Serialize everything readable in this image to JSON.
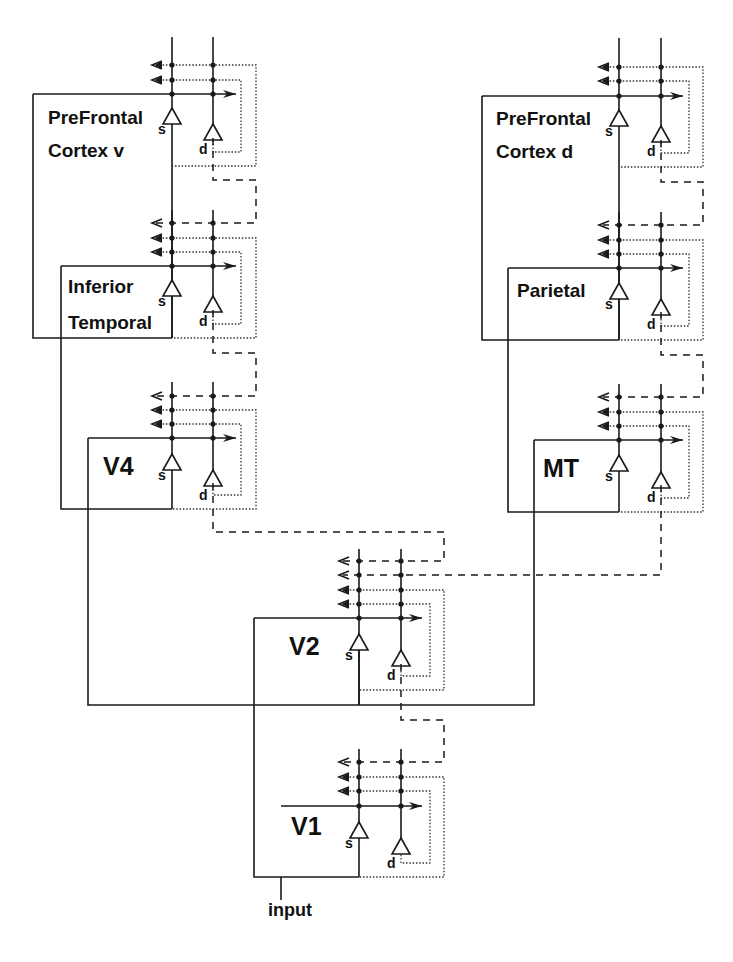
{
  "figure": {
    "type": "hierarchical cortical network diagram",
    "legend_line_styles": {
      "solid": "feedforward / module boundaries",
      "dotted": "within-module feedback loops",
      "dashed": "inter-module descending connections"
    }
  },
  "modules": [
    {
      "id": "pfcv",
      "label_lines": [
        "PreFrontal",
        "Cortex v"
      ],
      "label_size": "big",
      "s_x": 172,
      "d_x": 213,
      "top": 37,
      "dots": [
        65,
        80,
        94
      ],
      "box": {
        "x": 33,
        "y": 94,
        "w": 139,
        "h": 244
      },
      "label_pos": [
        48,
        124
      ],
      "line_gap": 33,
      "outer_x": 256,
      "inner_x": 241,
      "outer_bottom": 166,
      "inner_bottom": 152,
      "arrow_end": 236,
      "s_tri_y": 108,
      "d_tri_y": 124,
      "s_label": "s",
      "d_label": "d"
    },
    {
      "id": "it",
      "label_lines": [
        "Inferior",
        "Temporal"
      ],
      "label_size": "big",
      "s_x": 172,
      "d_x": 213,
      "top": 210,
      "dots": [
        223,
        238,
        252,
        266
      ],
      "box": {
        "x": 61,
        "y": 266,
        "w": 111,
        "h": 72
      },
      "label_pos": [
        68,
        293
      ],
      "line_gap": 36,
      "outer_x": 256,
      "inner_x": 241,
      "outer_bottom": 338,
      "inner_bottom": 324,
      "arrow_end": 236,
      "s_tri_y": 280,
      "d_tri_y": 296,
      "s_label": "s",
      "d_label": "d"
    },
    {
      "id": "v4",
      "label_lines": [
        "V4"
      ],
      "label_size": "huge",
      "s_x": 172,
      "d_x": 213,
      "top": 382,
      "dots": [
        396,
        410,
        424,
        438
      ],
      "box": {
        "x": 88,
        "y": 438,
        "w": 84,
        "h": 71
      },
      "label_pos": [
        103,
        475
      ],
      "line_gap": 0,
      "outer_x": 256,
      "inner_x": 241,
      "outer_bottom": 509,
      "inner_bottom": 495,
      "arrow_end": 236,
      "s_tri_y": 454,
      "d_tri_y": 470,
      "s_label": "s",
      "d_label": "d"
    },
    {
      "id": "pfcd",
      "label_lines": [
        "PreFrontal",
        "Cortex d"
      ],
      "label_size": "big",
      "s_x": 619,
      "d_x": 661,
      "top": 38,
      "dots": [
        67,
        81,
        96
      ],
      "box": {
        "x": 482,
        "y": 96,
        "w": 137,
        "h": 244
      },
      "label_pos": [
        496,
        125
      ],
      "line_gap": 33,
      "outer_x": 703,
      "inner_x": 689,
      "outer_bottom": 167,
      "inner_bottom": 153,
      "arrow_end": 683,
      "s_tri_y": 110,
      "d_tri_y": 126,
      "s_label": "s",
      "d_label": "d"
    },
    {
      "id": "parietal",
      "label_lines": [
        "Parietal"
      ],
      "label_size": "big",
      "s_x": 619,
      "d_x": 661,
      "top": 212,
      "dots": [
        225,
        240,
        254,
        268
      ],
      "box": {
        "x": 508,
        "y": 268,
        "w": 111,
        "h": 72
      },
      "label_pos": [
        517,
        297
      ],
      "line_gap": 0,
      "outer_x": 703,
      "inner_x": 689,
      "outer_bottom": 340,
      "inner_bottom": 326,
      "arrow_end": 683,
      "s_tri_y": 283,
      "d_tri_y": 299,
      "s_label": "s",
      "d_label": "d"
    },
    {
      "id": "mt",
      "label_lines": [
        "MT"
      ],
      "label_size": "huge",
      "s_x": 619,
      "d_x": 661,
      "top": 384,
      "dots": [
        397,
        412,
        426,
        440
      ],
      "box": {
        "x": 534,
        "y": 440,
        "w": 85,
        "h": 72
      },
      "label_pos": [
        543,
        477
      ],
      "line_gap": 0,
      "outer_x": 703,
      "inner_x": 689,
      "outer_bottom": 512,
      "inner_bottom": 498,
      "arrow_end": 683,
      "s_tri_y": 455,
      "d_tri_y": 472,
      "s_label": "s",
      "d_label": "d"
    },
    {
      "id": "v2",
      "label_lines": [
        "V2"
      ],
      "label_size": "huge",
      "s_x": 359,
      "d_x": 401,
      "top": 549,
      "dots": [
        561,
        575,
        590,
        604,
        618
      ],
      "box": {
        "x": 254,
        "y": 618,
        "w": 105,
        "h": 87
      },
      "label_pos": [
        289,
        655
      ],
      "line_gap": 0,
      "outer_x": 444,
      "inner_x": 430,
      "outer_bottom": 690,
      "inner_bottom": 676,
      "arrow_end": 422,
      "s_tri_y": 634,
      "d_tri_y": 650,
      "s_label": "s",
      "d_label": "d",
      "dotted_from": 2
    },
    {
      "id": "v1",
      "label_lines": [
        "V1"
      ],
      "label_size": "huge",
      "s_x": 359,
      "d_x": 401,
      "top": 749,
      "dots": [
        762,
        777,
        791,
        806
      ],
      "box": {
        "x": 281,
        "y": 806,
        "w": 78,
        "h": 71
      },
      "label_pos": [
        291,
        835
      ],
      "line_gap": 0,
      "outer_x": 444,
      "inner_x": 430,
      "outer_bottom": 877,
      "inner_bottom": 863,
      "arrow_end": 422,
      "s_tri_y": 822,
      "d_tri_y": 838,
      "s_label": "s",
      "d_label": "d"
    }
  ],
  "descending_dashed": [
    {
      "from": "pfcv",
      "points": [
        [
          213,
          138
        ],
        [
          213,
          180
        ],
        [
          256,
          180
        ],
        [
          256,
          223
        ],
        [
          156,
          223
        ]
      ]
    },
    {
      "from": "it",
      "points": [
        [
          213,
          310
        ],
        [
          213,
          353
        ],
        [
          256,
          353
        ],
        [
          256,
          396
        ],
        [
          156,
          396
        ]
      ]
    },
    {
      "from": "v4",
      "points": [
        [
          213,
          483
        ],
        [
          213,
          532
        ],
        [
          444,
          532
        ],
        [
          444,
          561
        ],
        [
          343,
          561
        ]
      ]
    },
    {
      "from": "pfcd",
      "points": [
        [
          661,
          140
        ],
        [
          661,
          182
        ],
        [
          703,
          182
        ],
        [
          703,
          225
        ],
        [
          603,
          225
        ]
      ]
    },
    {
      "from": "parietal",
      "points": [
        [
          661,
          312
        ],
        [
          661,
          355
        ],
        [
          703,
          355
        ],
        [
          703,
          397
        ],
        [
          603,
          397
        ]
      ]
    },
    {
      "from": "mt",
      "points": [
        [
          661,
          485
        ],
        [
          661,
          575
        ],
        [
          343,
          575
        ]
      ]
    },
    {
      "from": "v2",
      "points": [
        [
          401,
          664
        ],
        [
          401,
          720
        ],
        [
          444,
          720
        ],
        [
          444,
          762
        ],
        [
          343,
          762
        ]
      ]
    }
  ],
  "feedforward_solid": [
    {
      "name": "v1-to-v2-enclosure",
      "points": [
        [
          359,
          877
        ],
        [
          254,
          877
        ],
        [
          254,
          618
        ]
      ]
    },
    {
      "name": "v2-to-v4-mt-enclosure",
      "points": [
        [
          88,
          438
        ],
        [
          88,
          705
        ],
        [
          534,
          705
        ],
        [
          534,
          440
        ]
      ]
    },
    {
      "name": "v2-s-down",
      "points": [
        [
          359,
          650
        ],
        [
          359,
          705
        ]
      ]
    },
    {
      "name": "v4-to-it-enclosure",
      "points": [
        [
          61,
          266
        ],
        [
          61,
          509
        ],
        [
          172,
          509
        ]
      ]
    },
    {
      "name": "it-to-pfcv-enclosure",
      "points": [
        [
          33,
          94
        ],
        [
          33,
          338
        ],
        [
          172,
          338
        ]
      ]
    },
    {
      "name": "mt-to-parietal-enclosure",
      "points": [
        [
          508,
          268
        ],
        [
          508,
          512
        ],
        [
          619,
          512
        ]
      ]
    },
    {
      "name": "parietal-to-pfcd-enclosure",
      "points": [
        [
          482,
          96
        ],
        [
          482,
          340
        ],
        [
          619,
          340
        ]
      ]
    },
    {
      "name": "input-line",
      "points": [
        [
          281,
          877
        ],
        [
          281,
          900
        ]
      ]
    }
  ],
  "input": {
    "label": "input",
    "x": 268,
    "y": 916
  }
}
